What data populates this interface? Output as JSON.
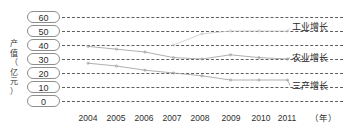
{
  "chart_data": {
    "type": "line",
    "title": "",
    "subtitle": "",
    "xlabel": "（年）",
    "ylabel": "产值（亿元）",
    "x": [
      "2004",
      "2005",
      "2006",
      "2007",
      "2008",
      "2009",
      "2010",
      "2011"
    ],
    "categories": [
      "2004",
      "2005",
      "2006",
      "2007",
      "2008",
      "2009",
      "2010",
      "2011"
    ],
    "ylim": [
      0,
      60
    ],
    "yticks": [
      "60",
      "50",
      "40",
      "30",
      "20",
      "10",
      "0"
    ],
    "ytick_values": [
      60,
      50,
      40,
      30,
      20,
      10,
      0
    ],
    "grid": true,
    "grid_style": "dashed-horizontal",
    "legend_position": "right-inline",
    "series": [
      {
        "name": "工业增长",
        "color": "#c9c9c9",
        "values": [
          null,
          null,
          null,
          40,
          48,
          50,
          50,
          50
        ],
        "label_y_value": 52
      },
      {
        "name": "农业增长",
        "color": "#9a9a9a",
        "values": [
          39,
          37,
          35,
          31,
          30,
          33,
          31,
          30
        ],
        "label_y_value": 31
      },
      {
        "name": "三产增长",
        "color": "#9a9a9a",
        "values": [
          27,
          25,
          22,
          20,
          18,
          15,
          15,
          15
        ],
        "label_y_value": 11
      }
    ]
  },
  "axes": {
    "y_caption_chars": [
      "产",
      "值",
      "（",
      "亿",
      "元",
      "）"
    ],
    "x_unit": "（年）"
  },
  "colors": {
    "background": "#ffffff",
    "gridline": "#5e5e5e",
    "tick_box_border": "#8d8d8d",
    "text": "#2e2e2e",
    "series_light": "#c9c9c9",
    "series_mid": "#9a9a9a"
  }
}
